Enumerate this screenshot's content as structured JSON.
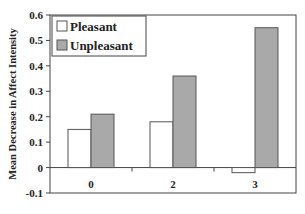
{
  "chart_data": {
    "type": "bar",
    "title": "",
    "xlabel": "",
    "ylabel": "Mean Decrease in Affect Intensity",
    "categories": [
      "0",
      "2",
      "3"
    ],
    "series": [
      {
        "name": "Pleasant",
        "values": [
          0.15,
          0.18,
          -0.02
        ],
        "color": "#ffffff"
      },
      {
        "name": "Unpleasant",
        "values": [
          0.21,
          0.36,
          0.55
        ],
        "color": "#a9a9a9"
      }
    ],
    "ylim": [
      -0.1,
      0.6
    ],
    "yticks": [
      -0.1,
      0,
      0.1,
      0.2,
      0.3,
      0.4,
      0.5,
      0.6
    ],
    "ytick_labels": [
      "-0.1",
      "0",
      "0.1",
      "0.2",
      "0.3",
      "0.4",
      "0.5",
      "0.6"
    ],
    "grid": false,
    "legend_position": "top-left"
  }
}
